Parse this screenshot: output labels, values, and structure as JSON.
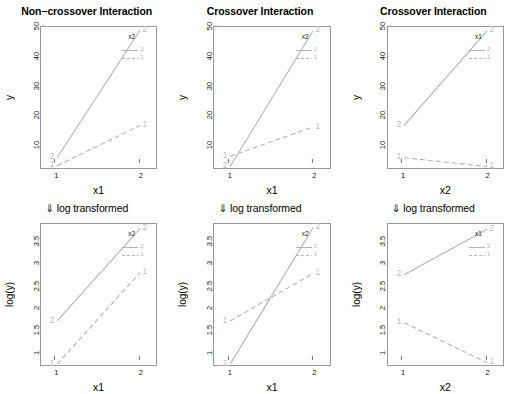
{
  "figure": {
    "rows": 2,
    "cols": 3,
    "line_color": "#b4b4b4",
    "frame_color": "#9a9a9a",
    "transform_note": "⇓  log transformed"
  },
  "panels": [
    {
      "id": "top-left",
      "title": "Non−crossover Interaction",
      "xlabel": "x1",
      "ylabel": "y",
      "legend_title": "x2",
      "legend_items": [
        "2",
        "1"
      ],
      "xticks": [
        "1",
        "2"
      ],
      "yticks": [
        "10",
        "20",
        "30",
        "40",
        "50"
      ]
    },
    {
      "id": "top-middle",
      "title": "Crossover Interaction",
      "xlabel": "x1",
      "ylabel": "y",
      "legend_title": "x2",
      "legend_items": [
        "2",
        "1"
      ],
      "xticks": [
        "1",
        "2"
      ],
      "yticks": [
        "10",
        "20",
        "30",
        "40",
        "50"
      ]
    },
    {
      "id": "top-right",
      "title": "Crossover Interaction",
      "xlabel": "x2",
      "ylabel": "y",
      "legend_title": "x1",
      "legend_items": [
        "2",
        "1"
      ],
      "xticks": [
        "1",
        "2"
      ],
      "yticks": [
        "10",
        "20",
        "30",
        "40",
        "50"
      ]
    },
    {
      "id": "bottom-left",
      "title": "⇓  log transformed",
      "xlabel": "x1",
      "ylabel": "log(y)",
      "legend_title": "x2",
      "legend_items": [
        "2",
        "1"
      ],
      "xticks": [
        "1",
        "2"
      ],
      "yticks": [
        "1.0",
        "1.5",
        "2.0",
        "2.5",
        "3.0",
        "3.5"
      ]
    },
    {
      "id": "bottom-middle",
      "title": "⇓ log transformed",
      "xlabel": "x1",
      "ylabel": "log(y)",
      "legend_title": "x2",
      "legend_items": [
        "2",
        "1"
      ],
      "xticks": [
        "1",
        "2"
      ],
      "yticks": [
        "1.0",
        "1.5",
        "2.0",
        "2.5",
        "3.0",
        "3.5"
      ]
    },
    {
      "id": "bottom-right",
      "title": "⇓  log transformed",
      "xlabel": "x2",
      "ylabel": "log(y)",
      "legend_title": "x1",
      "legend_items": [
        "2",
        "1"
      ],
      "xticks": [
        "1",
        "2"
      ],
      "yticks": [
        "1.0",
        "1.5",
        "2.0",
        "2.5",
        "3.0",
        "3.5"
      ]
    }
  ],
  "chart_data": [
    {
      "type": "line",
      "panel": "top-left",
      "title": "Non−crossover Interaction",
      "xlabel": "x1",
      "ylabel": "y",
      "x": [
        1,
        2
      ],
      "xticklabels": [
        "1",
        "2"
      ],
      "ylim": [
        2,
        50
      ],
      "yticks": [
        10,
        20,
        30,
        40,
        50
      ],
      "legend_title": "x2",
      "legend_position": "top-right",
      "grid": false,
      "series": [
        {
          "name": "2",
          "style": "solid",
          "point_labels": [
            "2",
            "2"
          ],
          "values": [
            5.5,
            49.0
          ]
        },
        {
          "name": "1",
          "style": "dashed",
          "point_labels": [
            "1",
            "1"
          ],
          "values": [
            2.8,
            16.5
          ]
        }
      ]
    },
    {
      "type": "line",
      "panel": "top-middle",
      "title": "Crossover Interaction",
      "xlabel": "x1",
      "ylabel": "y",
      "x": [
        1,
        2
      ],
      "xticklabels": [
        "1",
        "2"
      ],
      "ylim": [
        2,
        50
      ],
      "yticks": [
        10,
        20,
        30,
        40,
        50
      ],
      "legend_title": "x2",
      "legend_position": "top-right",
      "grid": false,
      "series": [
        {
          "name": "2",
          "style": "solid",
          "point_labels": [
            "2",
            "2"
          ],
          "values": [
            2.5,
            48.8
          ]
        },
        {
          "name": "1",
          "style": "dashed",
          "point_labels": [
            "1",
            "1"
          ],
          "values": [
            6.0,
            16.0
          ]
        }
      ]
    },
    {
      "type": "line",
      "panel": "top-right",
      "title": "Crossover Interaction",
      "xlabel": "x2",
      "ylabel": "y",
      "x": [
        1,
        2
      ],
      "xticklabels": [
        "1",
        "2"
      ],
      "ylim": [
        2,
        50
      ],
      "yticks": [
        10,
        20,
        30,
        40,
        50
      ],
      "legend_title": "x1",
      "legend_position": "top-right",
      "grid": false,
      "series": [
        {
          "name": "2",
          "style": "solid",
          "point_labels": [
            "2",
            "2"
          ],
          "values": [
            16.5,
            48.8
          ]
        },
        {
          "name": "1",
          "style": "dashed",
          "point_labels": [
            "1",
            "1"
          ],
          "values": [
            5.5,
            2.5
          ]
        }
      ]
    },
    {
      "type": "line",
      "panel": "bottom-left",
      "title": "⇓  log transformed",
      "xlabel": "x1",
      "ylabel": "log(y)",
      "x": [
        1,
        2
      ],
      "xticklabels": [
        "1",
        "2"
      ],
      "ylim": [
        0.7,
        3.9
      ],
      "yticks": [
        1.0,
        1.5,
        2.0,
        2.5,
        3.0,
        3.5
      ],
      "legend_title": "x2",
      "legend_position": "top-right",
      "grid": false,
      "series": [
        {
          "name": "2",
          "style": "solid",
          "point_labels": [
            "2",
            "2"
          ],
          "values": [
            1.7,
            3.8
          ]
        },
        {
          "name": "1",
          "style": "dashed",
          "point_labels": [
            "1",
            "1"
          ],
          "values": [
            0.72,
            2.8
          ]
        }
      ]
    },
    {
      "type": "line",
      "panel": "bottom-middle",
      "title": "⇓ log transformed",
      "xlabel": "x1",
      "ylabel": "log(y)",
      "x": [
        1,
        2
      ],
      "xticklabels": [
        "1",
        "2"
      ],
      "ylim": [
        0.7,
        3.9
      ],
      "yticks": [
        1.0,
        1.5,
        2.0,
        2.5,
        3.0,
        3.5
      ],
      "legend_title": "x2",
      "legend_position": "top-right",
      "grid": false,
      "series": [
        {
          "name": "2",
          "style": "solid",
          "point_labels": [
            "2",
            "2"
          ],
          "values": [
            0.72,
            3.82
          ]
        },
        {
          "name": "1",
          "style": "dashed",
          "point_labels": [
            "1",
            "1"
          ],
          "values": [
            1.7,
            2.78
          ]
        }
      ]
    },
    {
      "type": "line",
      "panel": "bottom-right",
      "title": "⇓  log transformed",
      "xlabel": "x2",
      "ylabel": "log(y)",
      "x": [
        1,
        2
      ],
      "xticklabels": [
        "1",
        "2"
      ],
      "ylim": [
        0.7,
        3.9
      ],
      "yticks": [
        1.0,
        1.5,
        2.0,
        2.5,
        3.0,
        3.5
      ],
      "legend_title": "x1",
      "legend_position": "top-right",
      "grid": false,
      "series": [
        {
          "name": "2",
          "style": "solid",
          "point_labels": [
            "2",
            "2"
          ],
          "values": [
            2.75,
            3.78
          ]
        },
        {
          "name": "1",
          "style": "dashed",
          "point_labels": [
            "1",
            "1"
          ],
          "values": [
            1.66,
            0.75
          ]
        }
      ]
    }
  ]
}
